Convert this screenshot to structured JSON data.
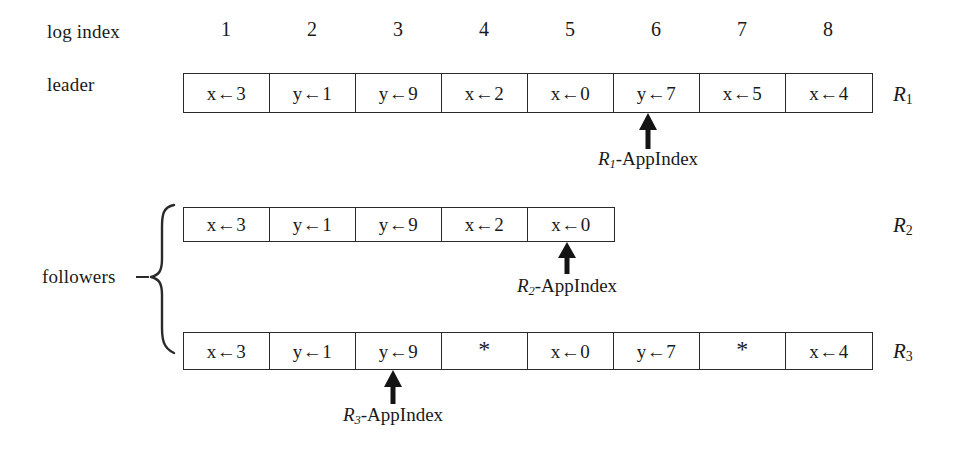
{
  "figure": {
    "row_label_log_index": "log index",
    "row_label_leader": "leader",
    "row_label_followers": "followers",
    "log_indices": [
      "1",
      "2",
      "3",
      "4",
      "5",
      "6",
      "7",
      "8"
    ],
    "assign_arrow": "←",
    "empty_cell_marker": "*",
    "ink_color": "#1a1a1a",
    "background_color": "#ffffff"
  },
  "rows": [
    {
      "replica": "R",
      "replica_subscript": "1",
      "role": "leader",
      "cells": [
        "x←3",
        "y←1",
        "y←9",
        "x←2",
        "x←0",
        "y←7",
        "x←5",
        "x←4"
      ],
      "appindex": {
        "label_prefix": "R",
        "label_subscript": "1",
        "label_suffix": "-AppIndex",
        "points_at_index": 6
      }
    },
    {
      "replica": "R",
      "replica_subscript": "2",
      "role": "follower",
      "cells": [
        "x←3",
        "y←1",
        "y←9",
        "x←2",
        "x←0"
      ],
      "appindex": {
        "label_prefix": "R",
        "label_subscript": "2",
        "label_suffix": "-AppIndex",
        "points_at_index": 5
      }
    },
    {
      "replica": "R",
      "replica_subscript": "3",
      "role": "follower",
      "cells": [
        "x←3",
        "y←1",
        "y←9",
        "*",
        "x←0",
        "y←7",
        "*",
        "x←4"
      ],
      "appindex": {
        "label_prefix": "R",
        "label_subscript": "3",
        "label_suffix": "-AppIndex",
        "points_at_index": 3
      }
    }
  ]
}
